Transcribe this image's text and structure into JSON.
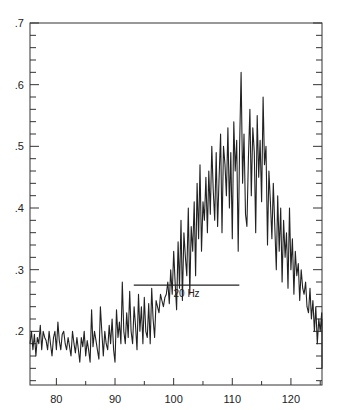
{
  "chart_data": {
    "type": "line",
    "title": "",
    "xlabel": "",
    "ylabel": "",
    "xlim": [
      75.5,
      125.3
    ],
    "ylim": [
      0.113,
      0.7
    ],
    "x_ticks": [
      80,
      90,
      100,
      110,
      120
    ],
    "x_tick_labels": [
      "80",
      "90",
      "100",
      "110",
      "120"
    ],
    "x_minor_step": 5,
    "y_ticks": [
      0.2,
      0.3,
      0.4,
      0.5,
      0.6,
      0.7
    ],
    "y_tick_labels": [
      ".2",
      ".3",
      ".4",
      ".5",
      ".6",
      ".7"
    ],
    "y_minor_step": 0.02,
    "grid": false,
    "legend": "none",
    "series": [
      {
        "name": "spectrum",
        "color": "#222222",
        "x_start": 75.5,
        "x_step": 0.25,
        "values": [
          0.18,
          0.2,
          0.17,
          0.195,
          0.16,
          0.19,
          0.18,
          0.21,
          0.17,
          0.2,
          0.19,
          0.185,
          0.17,
          0.2,
          0.18,
          0.16,
          0.19,
          0.2,
          0.17,
          0.215,
          0.185,
          0.17,
          0.195,
          0.2,
          0.18,
          0.17,
          0.19,
          0.175,
          0.16,
          0.2,
          0.18,
          0.165,
          0.19,
          0.17,
          0.15,
          0.19,
          0.175,
          0.2,
          0.16,
          0.185,
          0.17,
          0.15,
          0.235,
          0.175,
          0.2,
          0.185,
          0.17,
          0.155,
          0.24,
          0.2,
          0.16,
          0.2,
          0.18,
          0.17,
          0.21,
          0.18,
          0.22,
          0.17,
          0.15,
          0.235,
          0.19,
          0.215,
          0.18,
          0.28,
          0.2,
          0.18,
          0.23,
          0.19,
          0.265,
          0.2,
          0.18,
          0.24,
          0.21,
          0.17,
          0.26,
          0.2,
          0.24,
          0.18,
          0.255,
          0.2,
          0.19,
          0.245,
          0.18,
          0.27,
          0.22,
          0.19,
          0.25,
          0.24,
          0.23,
          0.26,
          0.25,
          0.24,
          0.255,
          0.26,
          0.28,
          0.245,
          0.3,
          0.26,
          0.33,
          0.28,
          0.235,
          0.345,
          0.27,
          0.38,
          0.25,
          0.36,
          0.32,
          0.29,
          0.4,
          0.26,
          0.37,
          0.33,
          0.41,
          0.29,
          0.44,
          0.35,
          0.47,
          0.33,
          0.41,
          0.38,
          0.45,
          0.36,
          0.46,
          0.39,
          0.5,
          0.43,
          0.38,
          0.49,
          0.37,
          0.45,
          0.52,
          0.36,
          0.5,
          0.47,
          0.42,
          0.53,
          0.4,
          0.49,
          0.35,
          0.54,
          0.46,
          0.51,
          0.33,
          0.5,
          0.62,
          0.44,
          0.52,
          0.39,
          0.37,
          0.48,
          0.56,
          0.42,
          0.53,
          0.49,
          0.36,
          0.55,
          0.45,
          0.51,
          0.41,
          0.58,
          0.47,
          0.5,
          0.34,
          0.46,
          0.41,
          0.35,
          0.44,
          0.37,
          0.3,
          0.42,
          0.33,
          0.4,
          0.28,
          0.38,
          0.32,
          0.36,
          0.27,
          0.4,
          0.3,
          0.35,
          0.26,
          0.33,
          0.29,
          0.31,
          0.25,
          0.3,
          0.27,
          0.26,
          0.28,
          0.24,
          0.23,
          0.27,
          0.22,
          0.25,
          0.2,
          0.24,
          0.18,
          0.22,
          0.2,
          0.23,
          0.19,
          0.21,
          0.18,
          0.2,
          0.22,
          0.19,
          0.17,
          0.21,
          0.18,
          0.16,
          0.2,
          0.19,
          0.2,
          0.18,
          0.17,
          0.2,
          0.16,
          0.19,
          0.18,
          0.17,
          0.2,
          0.16,
          0.15,
          0.19,
          0.18,
          0.21,
          0.2,
          0.19,
          0.17,
          0.22,
          0.18,
          0.2,
          0.16,
          0.19,
          0.17,
          0.14,
          0.2,
          0.18,
          0.16,
          0.22,
          0.19,
          0.17,
          0.18,
          0.16,
          0.19,
          0.18,
          0.17,
          0.2,
          0.19,
          0.17,
          0.175,
          0.21,
          0.2,
          0.18,
          0.16,
          0.2,
          0.175,
          0.19,
          0.17,
          0.2,
          0.16,
          0.18,
          0.2,
          0.17
        ]
      }
    ],
    "annotations": [
      {
        "type": "hline",
        "x_from": 93.2,
        "x_to": 111.2,
        "y": 0.275,
        "label": "20 Hz",
        "label_x": 102.2,
        "label_y": 0.255
      }
    ]
  }
}
